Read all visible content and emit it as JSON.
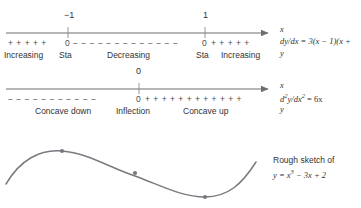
{
  "figure": {
    "type": "sign-analysis-diagram",
    "colors": {
      "line": "#6e6e6e",
      "curve": "#7a7a80",
      "text": "#333333",
      "background": "#ffffff"
    }
  },
  "first_derivative_line": {
    "axis_label": "x",
    "equation_prefix": "dy/dx = 3(x − 1)(x +",
    "equation_suffix": "y",
    "ticks": [
      {
        "label": "−1",
        "x": 68
      },
      {
        "label": "1",
        "x": 205
      }
    ],
    "sign_row": {
      "left_plus": "+ + + + +",
      "left_zero": "0",
      "middle_minus": "− − − − − − − − − − − − −",
      "right_zero": "0",
      "right_plus": "+ + + + +"
    },
    "descriptions": [
      {
        "label": "Increasing",
        "x": 4
      },
      {
        "label": "Sta",
        "x": 59
      },
      {
        "label": "Decreasing",
        "x": 107
      },
      {
        "label": "Sta",
        "x": 196
      },
      {
        "label": "Increasing",
        "x": 221
      }
    ]
  },
  "second_derivative_line": {
    "axis_label": "x",
    "equation_prefix": "d",
    "equation_body": "y/dx",
    "equation_tail": " = 6x",
    "equation_sup1": "2",
    "equation_sup2": "2",
    "equation_suffix": "y",
    "ticks": [
      {
        "label": "0",
        "x": 139
      }
    ],
    "sign_row": {
      "left_minus": "− − − − − − − − − − −",
      "zero": "0",
      "right_plus": "+ + + + + + + + + + + +"
    },
    "descriptions": [
      {
        "label": "Concave down",
        "x": 35
      },
      {
        "label": "Inflection",
        "x": 116
      },
      {
        "label": "Concave up",
        "x": 183
      }
    ]
  },
  "sketch": {
    "caption_line1": "Rough sketch of",
    "caption_line2_prefix": "y = x",
    "caption_line2_sup": "3",
    "caption_line2_suffix": " − 3x + 2",
    "points": [
      {
        "name": "local-maximum",
        "x": 62,
        "y": 151
      },
      {
        "name": "inflection-point",
        "x": 135,
        "y": 173
      },
      {
        "name": "local-minimum",
        "x": 205,
        "y": 197
      }
    ],
    "curve_path": "M 6,184 C 20,160 40,149 62,151 C 88,153 110,168 135,176 C 162,186 182,197 205,197 C 228,197 242,184 256,162"
  }
}
